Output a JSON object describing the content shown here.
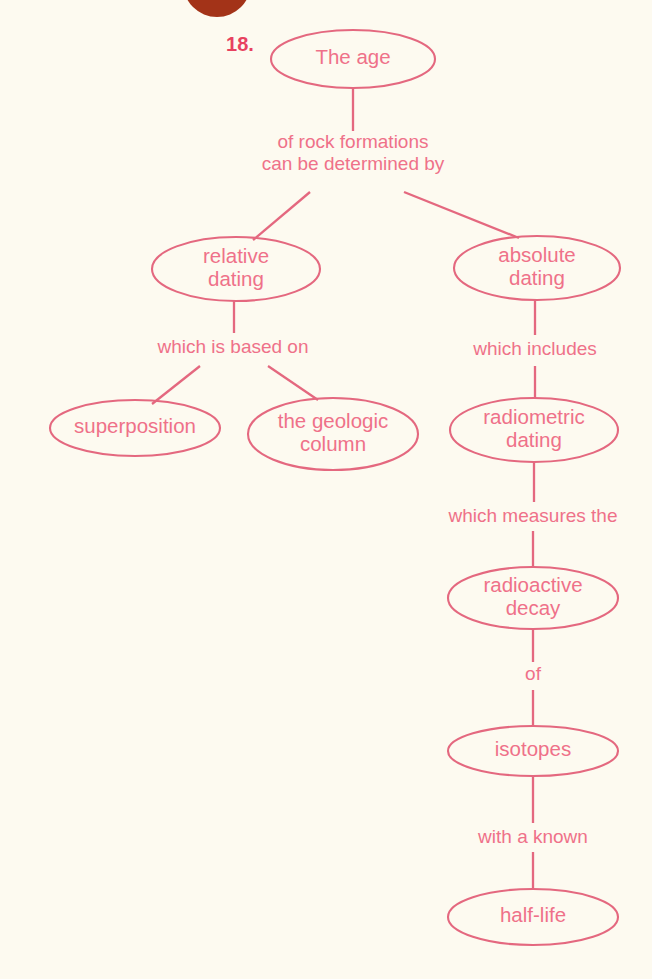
{
  "meta": {
    "item_number": "18.",
    "diagram_type": "concept-map",
    "colors": {
      "background": "#fdfaf0",
      "node_stroke": "#e4687f",
      "node_text": "#ef7189",
      "link_text": "#ef7189",
      "number_text": "#e8415f",
      "top_blob": "#a33318"
    }
  },
  "nodes": [
    {
      "id": "age",
      "label": "The age",
      "lines": [
        "The age"
      ],
      "cx": 353,
      "cy": 59,
      "rx": 82,
      "ry": 29
    },
    {
      "id": "relative",
      "label": "relative dating",
      "lines": [
        "relative",
        "dating"
      ],
      "cx": 236,
      "cy": 269,
      "rx": 84,
      "ry": 32
    },
    {
      "id": "absolute",
      "label": "absolute dating",
      "lines": [
        "absolute",
        "dating"
      ],
      "cx": 537,
      "cy": 268,
      "rx": 83,
      "ry": 32
    },
    {
      "id": "superposition",
      "label": "superposition",
      "lines": [
        "superposition"
      ],
      "cx": 135,
      "cy": 428,
      "rx": 85,
      "ry": 28
    },
    {
      "id": "geologic",
      "label": "the geologic column",
      "lines": [
        "the geologic",
        "column"
      ],
      "cx": 333,
      "cy": 434,
      "rx": 85,
      "ry": 36
    },
    {
      "id": "radiometric",
      "label": "radiometric dating",
      "lines": [
        "radiometric",
        "dating"
      ],
      "cx": 534,
      "cy": 430,
      "rx": 84,
      "ry": 32
    },
    {
      "id": "radioactive",
      "label": "radioactive decay",
      "lines": [
        "radioactive",
        "decay"
      ],
      "cx": 533,
      "cy": 598,
      "rx": 85,
      "ry": 31
    },
    {
      "id": "isotopes",
      "label": "isotopes",
      "lines": [
        "isotopes"
      ],
      "cx": 533,
      "cy": 751,
      "rx": 85,
      "ry": 25
    },
    {
      "id": "halflife",
      "label": "half-life",
      "lines": [
        "half-life"
      ],
      "cx": 533,
      "cy": 917,
      "rx": 85,
      "ry": 28
    }
  ],
  "links": [
    {
      "id": "l1",
      "text": "of rock formations can be determined by",
      "lines": [
        "of rock formations",
        "can be determined by"
      ],
      "cx": 353,
      "cy": 154
    },
    {
      "id": "l2",
      "text": "which is based on",
      "lines": [
        "which is based on"
      ],
      "cx": 233,
      "cy": 348
    },
    {
      "id": "l3",
      "text": "which includes",
      "lines": [
        "which includes"
      ],
      "cx": 535,
      "cy": 350
    },
    {
      "id": "l4",
      "text": "which measures the",
      "lines": [
        "which measures the"
      ],
      "cx": 533,
      "cy": 517
    },
    {
      "id": "l5",
      "text": "of",
      "lines": [
        "of"
      ],
      "cx": 533,
      "cy": 675
    },
    {
      "id": "l6",
      "text": "with a known",
      "lines": [
        "with a known"
      ],
      "cx": 533,
      "cy": 838
    }
  ],
  "edges": [
    {
      "id": "e-age-to-l1",
      "from": "age",
      "to": "l1",
      "x1": 353,
      "y1": 88,
      "x2": 353,
      "y2": 131
    },
    {
      "id": "e-l1-to-relative",
      "from": "l1",
      "to": "relative",
      "x1": 310,
      "y1": 192,
      "x2": 253,
      "y2": 240
    },
    {
      "id": "e-l1-to-absolute",
      "from": "l1",
      "to": "absolute",
      "x1": 404,
      "y1": 192,
      "x2": 519,
      "y2": 238
    },
    {
      "id": "e-relative-to-l2",
      "from": "relative",
      "to": "l2",
      "x1": 234,
      "y1": 301,
      "x2": 234,
      "y2": 333
    },
    {
      "id": "e-l2-to-superposition",
      "from": "l2",
      "to": "superposition",
      "x1": 200,
      "y1": 366,
      "x2": 152,
      "y2": 404
    },
    {
      "id": "e-l2-to-geologic",
      "from": "l2",
      "to": "geologic",
      "x1": 268,
      "y1": 366,
      "x2": 318,
      "y2": 400
    },
    {
      "id": "e-absolute-to-l3",
      "from": "absolute",
      "to": "l3",
      "x1": 535,
      "y1": 300,
      "x2": 535,
      "y2": 335
    },
    {
      "id": "e-l3-to-radiometric",
      "from": "l3",
      "to": "radiometric",
      "x1": 535,
      "y1": 366,
      "x2": 535,
      "y2": 399
    },
    {
      "id": "e-radiometric-to-l4",
      "from": "radiometric",
      "to": "l4",
      "x1": 534,
      "y1": 462,
      "x2": 534,
      "y2": 502
    },
    {
      "id": "e-l4-to-radioactive",
      "from": "l4",
      "to": "radioactive",
      "x1": 533,
      "y1": 531,
      "x2": 533,
      "y2": 567
    },
    {
      "id": "e-radioactive-to-l5",
      "from": "radioactive",
      "to": "l5",
      "x1": 533,
      "y1": 629,
      "x2": 533,
      "y2": 662
    },
    {
      "id": "e-l5-to-isotopes",
      "from": "l5",
      "to": "isotopes",
      "x1": 533,
      "y1": 690,
      "x2": 533,
      "y2": 726
    },
    {
      "id": "e-isotopes-to-l6",
      "from": "isotopes",
      "to": "l6",
      "x1": 533,
      "y1": 776,
      "x2": 533,
      "y2": 823
    },
    {
      "id": "e-l6-to-halflife",
      "from": "l6",
      "to": "halflife",
      "x1": 533,
      "y1": 852,
      "x2": 533,
      "y2": 889
    }
  ],
  "number_marker": {
    "label": "18.",
    "x": 240,
    "y": 46
  },
  "top_blob": {
    "cx": 217,
    "cy": -17,
    "rx": 34,
    "ry": 34
  }
}
